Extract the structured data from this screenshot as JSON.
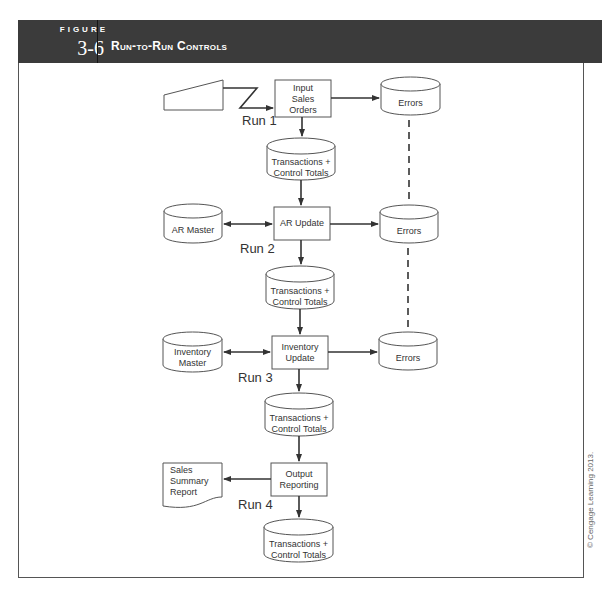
{
  "figure": {
    "label": "FIGURE",
    "number": "3-6",
    "title": "Run-to-Run Controls"
  },
  "copyright": "© Cengage Learning 2013.",
  "nodes": {
    "keyboard_input": {
      "shape": "manual-input",
      "label": ""
    },
    "run1_process": {
      "shape": "process",
      "label": "Input Sales Orders",
      "lines": [
        "Input",
        "Sales",
        "Orders"
      ]
    },
    "run1_errors": {
      "shape": "disk",
      "label": "Errors"
    },
    "run1_transactions": {
      "shape": "disk",
      "lines": [
        "Transactions +",
        "Control Totals"
      ]
    },
    "ar_master": {
      "shape": "disk",
      "label": "AR Master"
    },
    "run2_process": {
      "shape": "process",
      "label": "AR Update"
    },
    "run2_errors": {
      "shape": "disk",
      "label": "Errors"
    },
    "run2_transactions": {
      "shape": "disk",
      "lines": [
        "Transactions +",
        "Control Totals"
      ]
    },
    "inventory_master": {
      "shape": "disk",
      "lines": [
        "Inventory",
        "Master"
      ]
    },
    "run3_process": {
      "shape": "process",
      "lines": [
        "Inventory",
        "Update"
      ]
    },
    "run3_errors": {
      "shape": "disk",
      "label": "Errors"
    },
    "run3_transactions": {
      "shape": "disk",
      "lines": [
        "Transactions +",
        "Control Totals"
      ]
    },
    "sales_report": {
      "shape": "document",
      "lines": [
        "Sales",
        "Summary",
        "Report"
      ]
    },
    "run4_process": {
      "shape": "process",
      "lines": [
        "Output",
        "Reporting"
      ]
    },
    "run4_transactions": {
      "shape": "disk",
      "lines": [
        "Transactions +",
        "Control Totals"
      ]
    }
  },
  "runs": [
    "Run 1",
    "Run 2",
    "Run 3",
    "Run 4"
  ],
  "edges": [
    {
      "from": "keyboard_input",
      "to": "run1_process",
      "style": "lightning"
    },
    {
      "from": "run1_process",
      "to": "run1_errors"
    },
    {
      "from": "run1_process",
      "to": "run1_transactions"
    },
    {
      "from": "run1_transactions",
      "to": "run2_process"
    },
    {
      "from": "ar_master",
      "to": "run2_process",
      "bidirectional": true
    },
    {
      "from": "run2_process",
      "to": "run2_errors"
    },
    {
      "from": "run2_process",
      "to": "run2_transactions"
    },
    {
      "from": "run2_transactions",
      "to": "run3_process"
    },
    {
      "from": "inventory_master",
      "to": "run3_process",
      "bidirectional": true
    },
    {
      "from": "run3_process",
      "to": "run3_errors"
    },
    {
      "from": "run3_process",
      "to": "run3_transactions"
    },
    {
      "from": "run3_transactions",
      "to": "run4_process"
    },
    {
      "from": "run4_process",
      "to": "sales_report"
    },
    {
      "from": "run4_process",
      "to": "run4_transactions"
    },
    {
      "from": "run1_errors",
      "to": "run2_errors",
      "style": "dashed"
    },
    {
      "from": "run2_errors",
      "to": "run3_errors",
      "style": "dashed"
    }
  ]
}
